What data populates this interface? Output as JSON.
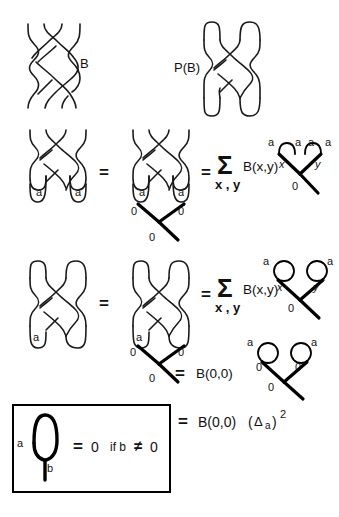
{
  "figure": {
    "stroke_color": "#1a1a1a",
    "thick_stroke_color": "#000000",
    "background": "#ffffff",
    "box_border": "#000000"
  },
  "row1": {
    "braid_label": "B",
    "plat_label": "P(B)"
  },
  "row2": {
    "eq1": "=",
    "eq2": "=",
    "sigma": "Σ",
    "sigma_sub": "x , y",
    "coeff": "B(x,y)",
    "left_cap_labels": [
      "a",
      "a"
    ],
    "mid_cap_labels": [
      "a",
      "a"
    ],
    "mid_vertex_labels": [
      "0",
      "0",
      "0"
    ],
    "right_arc_labels": [
      "a",
      "a",
      "a",
      "a"
    ],
    "right_vertex_labels": [
      "x",
      "y",
      "0"
    ]
  },
  "row3": {
    "eq1": "=",
    "eq2": "=",
    "sigma": "Σ",
    "sigma_sub": "x , y",
    "coeff": "B(x,y)",
    "left_cap_label": "a",
    "mid_cap_label": "a",
    "mid_vertex_labels": [
      "0",
      "0",
      "0"
    ],
    "right_loop_labels": [
      "a",
      "a"
    ],
    "right_vertex_labels": [
      "x",
      "y",
      "0"
    ]
  },
  "row4": {
    "eq": "=",
    "coeff": "B(0,0)",
    "loop_labels": [
      "a",
      "a"
    ],
    "vertex_labels": [
      "0",
      "0",
      "0"
    ]
  },
  "row5": {
    "box_rule": {
      "loop_top_label": "a",
      "stem_label": "b",
      "equals": "=",
      "value": "0",
      "condition_prefix": "if b",
      "condition_symbol": "≠",
      "condition_value": "0"
    },
    "result": {
      "equals": "=",
      "coeff": "B(0,0)",
      "open_paren": "(",
      "delta": "Δ",
      "delta_sub": "a",
      "close_paren": ")",
      "exponent": "2"
    }
  }
}
